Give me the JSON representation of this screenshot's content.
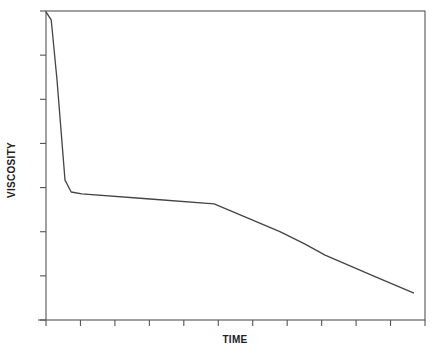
{
  "chart_data": {
    "type": "line",
    "title": "",
    "xlabel": "TIME",
    "ylabel": "VISCOSITY",
    "xlim": [
      0,
      11
    ],
    "ylim": [
      0,
      7
    ],
    "x_ticks": 12,
    "y_ticks": 8,
    "tick_labels_shown": false,
    "grid": false,
    "legend": null,
    "frame": "box",
    "series": [
      {
        "name": "viscosity",
        "color": "#444444",
        "x": [
          0,
          0.15,
          0.32,
          0.55,
          0.73,
          1.04,
          3.02,
          4.88,
          6.79,
          7.52,
          8.1,
          9.55,
          10.68
        ],
        "y": [
          6.98,
          6.8,
          5.44,
          3.17,
          2.9,
          2.86,
          2.74,
          2.63,
          2.0,
          1.72,
          1.47,
          0.98,
          0.61
        ]
      }
    ]
  },
  "labels": {
    "x": "TIME",
    "y": "VISCOSITY"
  }
}
